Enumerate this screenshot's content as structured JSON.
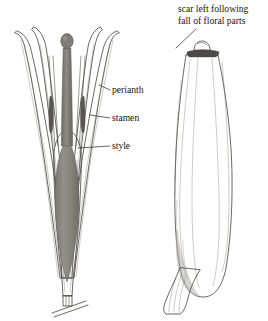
{
  "figure": {
    "background_color": "#ffffff",
    "ink_color": "#3a3632",
    "ovary_fill_color": "#8d8a86",
    "style_fill_color": "#7e7b77",
    "anther_fill_color": "#57534f",
    "panels": [
      {
        "id": "flower-section",
        "name": "flower-longitudinal-section",
        "position": "left"
      },
      {
        "id": "fruit",
        "name": "mature-fruit",
        "position": "right"
      }
    ],
    "labels": [
      {
        "id": "perianth",
        "text": "perianth",
        "x": 112,
        "y": 93,
        "anchor": "start",
        "leader": "M 110 90 L 99 85"
      },
      {
        "id": "stamen",
        "text": "stamen",
        "x": 112,
        "y": 121,
        "anchor": "start",
        "leader": "M 110 118 L 90 115"
      },
      {
        "id": "style",
        "text": "style",
        "x": 112,
        "y": 149,
        "anchor": "start",
        "leader": "M 110 146 L 78 148"
      }
    ],
    "callout": {
      "id": "scar-callout",
      "line1": "scar left following",
      "line2": "fall of floral parts",
      "x": 178,
      "y1": 12,
      "y2": 24,
      "leader": "M 196 29 L 176 48"
    }
  }
}
